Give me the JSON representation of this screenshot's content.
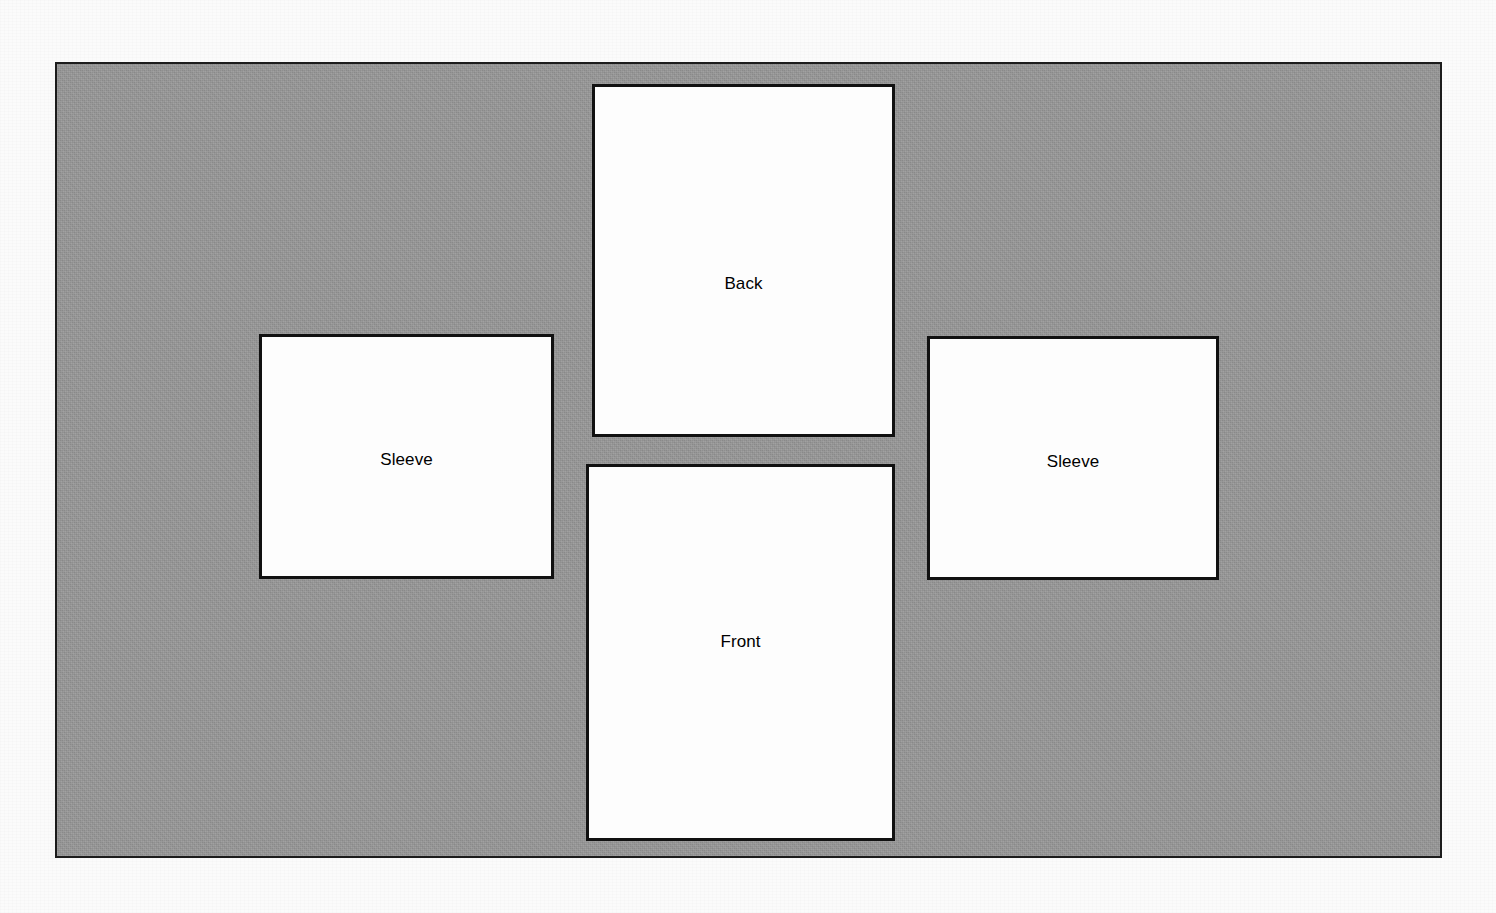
{
  "page": {
    "background_color": "#fbfbfb"
  },
  "fabric": {
    "name": "fabric-layout-sheet",
    "fill_color": "#979797",
    "border_color": "#1c1c1c"
  },
  "pieces": [
    {
      "id": "back",
      "label": "Back",
      "fill_color": "#fdfdfd",
      "border_color": "#111111"
    },
    {
      "id": "front",
      "label": "Front",
      "fill_color": "#fdfdfd",
      "border_color": "#111111"
    },
    {
      "id": "sleeve-left",
      "label": "Sleeve",
      "fill_color": "#fdfdfd",
      "border_color": "#111111"
    },
    {
      "id": "sleeve-right",
      "label": "Sleeve",
      "fill_color": "#fdfdfd",
      "border_color": "#111111"
    }
  ]
}
